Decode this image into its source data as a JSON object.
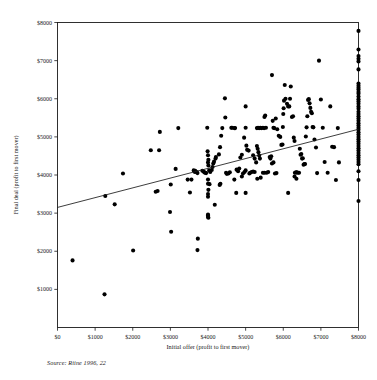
{
  "chart_data": {
    "type": "scatter",
    "title": "",
    "subtitle": "",
    "xlabel": "Initial offer (profit to first mover)",
    "ylabel": "Final deal (profit to first mover)",
    "xlim": [
      0,
      8000
    ],
    "ylim": [
      0,
      8000
    ],
    "grid": false,
    "legend": "none",
    "source_note": "Source: Riine 1996, 22",
    "xticks": [
      0,
      1000,
      2000,
      3000,
      4000,
      5000,
      6000,
      7000,
      8000
    ],
    "xtick_labels": [
      "$0",
      "$1000",
      "$2000",
      "$3000",
      "$4000",
      "$5000",
      "$6000",
      "$7000",
      "$8000"
    ],
    "yticks": [
      1000,
      2000,
      3000,
      4000,
      5000,
      6000,
      7000,
      8000
    ],
    "ytick_labels": [
      "$1000",
      "$2000",
      "$3000",
      "$4000",
      "$5000",
      "$6000",
      "$7000",
      "$8000"
    ],
    "marker": {
      "shape": "circle",
      "size_px": 3.0,
      "color": "#000000"
    },
    "trendline": {
      "type": "linear",
      "x": [
        0,
        8000
      ],
      "y": [
        3150,
        5200
      ],
      "color": "#1a1a1a"
    },
    "point_count": 233,
    "points": [
      [
        400,
        1760
      ],
      [
        1250,
        870
      ],
      [
        2010,
        2020
      ],
      [
        3020,
        2510
      ],
      [
        3720,
        2030
      ],
      [
        3730,
        2330
      ],
      [
        1270,
        3450
      ],
      [
        1520,
        3230
      ],
      [
        1740,
        4040
      ],
      [
        2480,
        4650
      ],
      [
        2720,
        5130
      ],
      [
        2700,
        4650
      ],
      [
        2610,
        3560
      ],
      [
        2660,
        3580
      ],
      [
        2990,
        3030
      ],
      [
        3010,
        3750
      ],
      [
        3140,
        4160
      ],
      [
        3210,
        5230
      ],
      [
        3460,
        3880
      ],
      [
        3520,
        3540
      ],
      [
        3560,
        3880
      ],
      [
        3620,
        4120
      ],
      [
        3650,
        4080
      ],
      [
        3660,
        4110
      ],
      [
        3700,
        4080
      ],
      [
        3720,
        4050
      ],
      [
        3980,
        5240
      ],
      [
        3990,
        4620
      ],
      [
        4000,
        4520
      ],
      [
        4010,
        4400
      ],
      [
        4000,
        4330
      ],
      [
        4010,
        4250
      ],
      [
        4000,
        3880
      ],
      [
        4000,
        3770
      ],
      [
        4010,
        3610
      ],
      [
        4000,
        3500
      ],
      [
        4000,
        3430
      ],
      [
        4010,
        2880
      ],
      [
        4000,
        2900
      ],
      [
        4000,
        2940
      ],
      [
        4000,
        2960
      ],
      [
        4180,
        3220
      ],
      [
        4200,
        4430
      ],
      [
        4210,
        4470
      ],
      [
        4290,
        4540
      ],
      [
        4320,
        4730
      ],
      [
        4350,
        5030
      ],
      [
        4380,
        5230
      ],
      [
        4450,
        6010
      ],
      [
        4460,
        5510
      ],
      [
        4310,
        3740
      ],
      [
        4330,
        3770
      ],
      [
        4480,
        4060
      ],
      [
        4500,
        4030
      ],
      [
        4620,
        5240
      ],
      [
        4640,
        5240
      ],
      [
        4700,
        5230
      ],
      [
        4720,
        5230
      ],
      [
        4760,
        4140
      ],
      [
        4800,
        4100
      ],
      [
        4830,
        4170
      ],
      [
        4860,
        4460
      ],
      [
        4900,
        4530
      ],
      [
        4960,
        4980
      ],
      [
        5000,
        5240
      ],
      [
        5000,
        5800
      ],
      [
        5020,
        4770
      ],
      [
        5040,
        4660
      ],
      [
        5080,
        4640
      ],
      [
        5100,
        4040
      ],
      [
        5120,
        4060
      ],
      [
        5160,
        4080
      ],
      [
        5200,
        4090
      ],
      [
        5240,
        4080
      ],
      [
        5000,
        3530
      ],
      [
        4750,
        3530
      ],
      [
        4700,
        3880
      ],
      [
        5300,
        5230
      ],
      [
        5330,
        5240
      ],
      [
        5360,
        5230
      ],
      [
        5390,
        5240
      ],
      [
        5420,
        5230
      ],
      [
        5460,
        5240
      ],
      [
        5490,
        5230
      ],
      [
        5500,
        5520
      ],
      [
        5520,
        5560
      ],
      [
        5540,
        5240
      ],
      [
        5300,
        4760
      ],
      [
        5320,
        4690
      ],
      [
        5340,
        4600
      ],
      [
        5360,
        4510
      ],
      [
        5380,
        4430
      ],
      [
        5200,
        4520
      ],
      [
        5240,
        4430
      ],
      [
        5280,
        4330
      ],
      [
        5310,
        3900
      ],
      [
        5400,
        3930
      ],
      [
        5460,
        4060
      ],
      [
        5500,
        4060
      ],
      [
        5560,
        4060
      ],
      [
        5600,
        4080
      ],
      [
        5640,
        4470
      ],
      [
        5680,
        4490
      ],
      [
        5700,
        6620
      ],
      [
        5720,
        5420
      ],
      [
        5740,
        5240
      ],
      [
        5760,
        5230
      ],
      [
        5800,
        5480
      ],
      [
        5840,
        5200
      ],
      [
        5880,
        5030
      ],
      [
        5920,
        5000
      ],
      [
        5950,
        4790
      ],
      [
        5980,
        4800
      ],
      [
        5990,
        5260
      ],
      [
        6000,
        5600
      ],
      [
        6010,
        5750
      ],
      [
        6020,
        5950
      ],
      [
        6040,
        6360
      ],
      [
        6060,
        6000
      ],
      [
        6100,
        5870
      ],
      [
        6130,
        5800
      ],
      [
        6160,
        5800
      ],
      [
        6180,
        6000
      ],
      [
        6200,
        6320
      ],
      [
        6230,
        5520
      ],
      [
        6260,
        5540
      ],
      [
        6280,
        4980
      ],
      [
        6300,
        4890
      ],
      [
        6310,
        4060
      ],
      [
        6340,
        4070
      ],
      [
        6360,
        4070
      ],
      [
        6390,
        4060
      ],
      [
        6420,
        4060
      ],
      [
        6440,
        4690
      ],
      [
        6460,
        4530
      ],
      [
        6480,
        4550
      ],
      [
        6500,
        4430
      ],
      [
        6520,
        4440
      ],
      [
        6540,
        4270
      ],
      [
        6560,
        4290
      ],
      [
        6580,
        4290
      ],
      [
        6600,
        5010
      ],
      [
        6620,
        5250
      ],
      [
        6640,
        5540
      ],
      [
        6660,
        5970
      ],
      [
        6680,
        5990
      ],
      [
        6700,
        5880
      ],
      [
        6720,
        5760
      ],
      [
        6740,
        5660
      ],
      [
        6760,
        5620
      ],
      [
        6780,
        5260
      ],
      [
        6800,
        5250
      ],
      [
        6830,
        4930
      ],
      [
        6870,
        4720
      ],
      [
        6900,
        4050
      ],
      [
        6950,
        7000
      ],
      [
        7000,
        5980
      ],
      [
        7050,
        5240
      ],
      [
        7100,
        4340
      ],
      [
        7180,
        4060
      ],
      [
        7250,
        5800
      ],
      [
        7300,
        4740
      ],
      [
        7350,
        4730
      ],
      [
        7400,
        3870
      ],
      [
        7450,
        5230
      ],
      [
        7480,
        4330
      ],
      [
        6130,
        3530
      ],
      [
        5780,
        4040
      ],
      [
        5820,
        4050
      ],
      [
        4030,
        4120
      ],
      [
        4040,
        3760
      ],
      [
        4060,
        4080
      ],
      [
        4100,
        4130
      ],
      [
        4120,
        4210
      ],
      [
        4140,
        4300
      ],
      [
        4160,
        4350
      ],
      [
        3850,
        4110
      ],
      [
        3880,
        4100
      ],
      [
        3900,
        4070
      ],
      [
        3930,
        4060
      ],
      [
        3950,
        4050
      ],
      [
        4540,
        4040
      ],
      [
        4580,
        4070
      ],
      [
        5660,
        4430
      ],
      [
        5700,
        4300
      ],
      [
        5740,
        4330
      ],
      [
        4900,
        3960
      ],
      [
        4930,
        4040
      ],
      [
        4970,
        4080
      ],
      [
        5000,
        4120
      ],
      [
        6300,
        3960
      ],
      [
        6350,
        3900
      ],
      [
        8000,
        7780
      ],
      [
        8000,
        7290
      ],
      [
        8000,
        7120
      ],
      [
        8000,
        7050
      ],
      [
        8000,
        6980
      ],
      [
        8000,
        6770
      ],
      [
        8000,
        6400
      ],
      [
        8000,
        6340
      ],
      [
        8000,
        6290
      ],
      [
        8000,
        6240
      ],
      [
        8000,
        6180
      ],
      [
        8000,
        6130
      ],
      [
        8000,
        6060
      ],
      [
        8000,
        5990
      ],
      [
        8000,
        5930
      ],
      [
        8000,
        5870
      ],
      [
        8000,
        5800
      ],
      [
        8000,
        5740
      ],
      [
        8000,
        5660
      ],
      [
        8000,
        5600
      ],
      [
        8000,
        5540
      ],
      [
        8000,
        5480
      ],
      [
        8000,
        5420
      ],
      [
        8000,
        5360
      ],
      [
        8000,
        5300
      ],
      [
        8000,
        5240
      ],
      [
        8000,
        5190
      ],
      [
        8000,
        5120
      ],
      [
        8000,
        5060
      ],
      [
        8000,
        5000
      ],
      [
        8000,
        4940
      ],
      [
        8000,
        4880
      ],
      [
        8000,
        4820
      ],
      [
        8000,
        4760
      ],
      [
        8000,
        4700
      ],
      [
        8000,
        4640
      ],
      [
        8000,
        4580
      ],
      [
        8000,
        4520
      ],
      [
        8000,
        4460
      ],
      [
        8000,
        4400
      ],
      [
        8000,
        4340
      ],
      [
        8000,
        4280
      ],
      [
        8000,
        4100
      ],
      [
        8000,
        3870
      ],
      [
        8000,
        3320
      ]
    ]
  }
}
